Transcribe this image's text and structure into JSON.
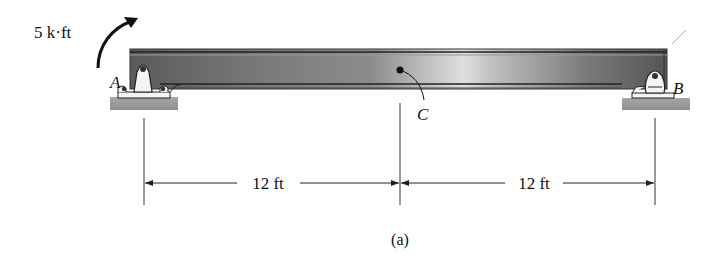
{
  "figure": {
    "caption": "(a)",
    "type": "simply supported beam with applied couple moment"
  },
  "loads": {
    "moment_label": "5 k·ft",
    "moment_direction": "clockwise"
  },
  "points": {
    "support_a_label": "A",
    "support_b_label": "B",
    "point_c_label": "C"
  },
  "dimensions": {
    "segment_1_label": "12 ft",
    "segment_2_label": "12 ft"
  },
  "colors": {
    "beam_dark": "#555555",
    "beam_light": "#d8d8d8",
    "ground": "#9a9a9a",
    "line": "#222222"
  }
}
